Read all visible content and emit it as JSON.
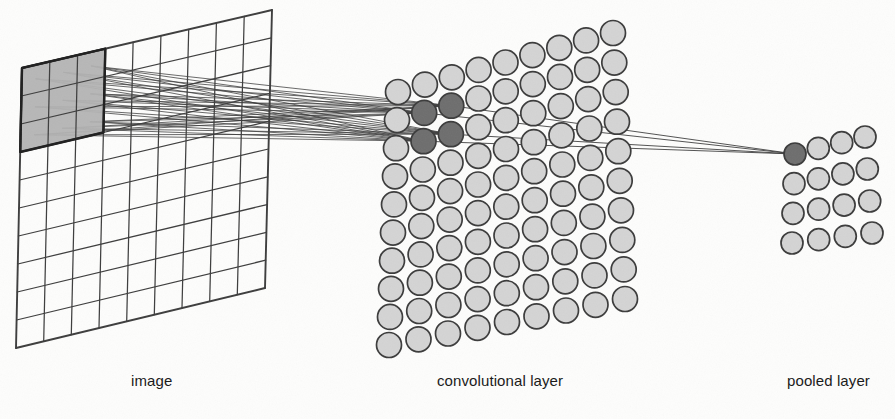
{
  "figure": {
    "background_color": "#fdfdfc"
  },
  "captions": {
    "image": "image",
    "convolutional_layer": "convolutional layer",
    "pooled_layer": "pooled layer"
  },
  "colors": {
    "stroke": "#2b2b2b",
    "line": "#3a3a3a",
    "circle_fill": "#d4d4d4",
    "circle_fill_highlight": "#6e6e6e",
    "patch_fill": "#b4b4b4",
    "grid_line": "#3d3d3d",
    "text": "#1b1b1b"
  },
  "image_plane": {
    "name": "image",
    "cols": 9,
    "rows": 10,
    "corners": {
      "top_left": [
        22,
        68
      ],
      "top_right": [
        272,
        10
      ],
      "bottom_right": [
        265,
        288
      ],
      "bottom_left": [
        16,
        348
      ]
    },
    "receptive_field": {
      "col_start": 0,
      "col_end": 3,
      "row_start": 0,
      "row_end": 3,
      "label": "3x3 receptive field"
    }
  },
  "conv_layer": {
    "name": "convolutional layer",
    "cols": 9,
    "rows": 10,
    "corners": {
      "top_left": [
        398,
        92
      ],
      "top_right": [
        613,
        33
      ],
      "bottom_right": [
        625,
        299
      ],
      "bottom_left": [
        389,
        345
      ]
    },
    "circle_radius": 12.5,
    "highlighted_units": [
      {
        "col": 1,
        "row": 1
      },
      {
        "col": 2,
        "row": 1
      },
      {
        "col": 1,
        "row": 2
      },
      {
        "col": 2,
        "row": 2
      }
    ]
  },
  "pooled_layer": {
    "name": "pooled layer",
    "cols": 4,
    "rows": 4,
    "corners": {
      "top_left": [
        795,
        154
      ],
      "top_right": [
        865,
        137
      ],
      "bottom_right": [
        872,
        233
      ],
      "bottom_left": [
        792,
        243
      ]
    },
    "circle_radius": 11,
    "highlighted_units": [
      {
        "col": 0,
        "row": 0
      }
    ]
  },
  "connections": {
    "image_to_conv": {
      "description": "lines from each cell of the 3x3 receptive field to each of the 4 highlighted convolutional units",
      "source_cells": 9,
      "target_units": 4
    },
    "conv_to_pool": {
      "description": "lines from the 4 highlighted convolutional units to the single highlighted pooled unit",
      "source_units": 4,
      "target_units": 1
    }
  }
}
